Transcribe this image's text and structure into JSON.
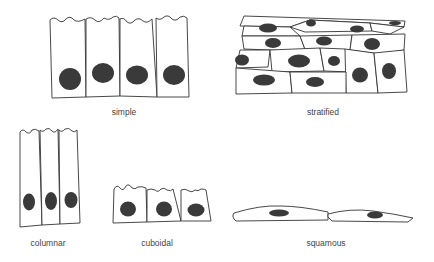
{
  "diagram": {
    "title": "",
    "colors": {
      "outline": "#333333",
      "nucleus": "#3a3a3a",
      "background": "#ffffff"
    },
    "panels": [
      {
        "id": "simple",
        "label": "simple",
        "cells": 4,
        "shape": "tall columnar row with wavy apical edge"
      },
      {
        "id": "stratified",
        "label": "stratified",
        "cells": "multiple layers",
        "shape": "stacked irregular cells, flattening toward top"
      },
      {
        "id": "columnar",
        "label": "columnar",
        "cells": 3,
        "shape": "tall narrow columns"
      },
      {
        "id": "cuboidal",
        "label": "cuboidal",
        "cells": 3,
        "shape": "square cells"
      },
      {
        "id": "squamous",
        "label": "squamous",
        "cells": 2,
        "shape": "flat elongated cells"
      }
    ]
  }
}
